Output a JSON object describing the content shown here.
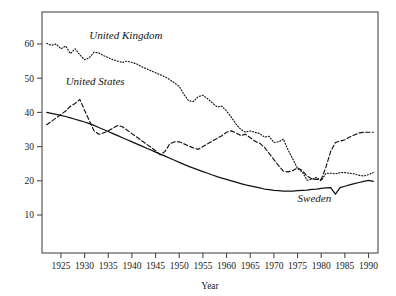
{
  "chart_data": {
    "type": "line",
    "title": "",
    "subtitle": "",
    "xlabel": "Year",
    "ylabel": "",
    "xlim": [
      1921,
      1992
    ],
    "ylim": [
      0,
      65
    ],
    "grid": false,
    "legend_position": "inline-annotations",
    "xticks": [
      1925,
      1930,
      1935,
      1940,
      1945,
      1950,
      1955,
      1960,
      1965,
      1970,
      1975,
      1980,
      1985,
      1990
    ],
    "yticks": [
      10,
      20,
      30,
      40,
      50,
      60
    ],
    "annotations": [
      {
        "text": "United Kingdom",
        "x": 1931,
        "y": 61.5,
        "series": "United Kingdom"
      },
      {
        "text": "United States",
        "x": 1926,
        "y": 48.0,
        "series": "United States"
      },
      {
        "text": "Sweden",
        "x": 1975,
        "y": 13.8,
        "series": "Sweden"
      }
    ],
    "series": [
      {
        "name": "United Kingdom",
        "style": "dotted",
        "x": [
          1922,
          1923,
          1924,
          1925,
          1926,
          1927,
          1928,
          1929,
          1930,
          1931,
          1932,
          1933,
          1934,
          1935,
          1936,
          1937,
          1938,
          1939,
          1940,
          1941,
          1942,
          1943,
          1944,
          1945,
          1946,
          1947,
          1948,
          1949,
          1950,
          1951,
          1952,
          1953,
          1954,
          1955,
          1956,
          1957,
          1958,
          1959,
          1960,
          1961,
          1962,
          1963,
          1964,
          1965,
          1966,
          1967,
          1968,
          1969,
          1970,
          1971,
          1972,
          1973,
          1974,
          1975,
          1976,
          1977,
          1978,
          1979,
          1980,
          1981,
          1982,
          1983,
          1984,
          1985,
          1986,
          1987,
          1988,
          1989,
          1990,
          1991
        ],
        "y": [
          60.2,
          59.6,
          60.0,
          58.6,
          59.4,
          57.2,
          58.6,
          56.8,
          55.4,
          56.0,
          57.6,
          57.4,
          56.6,
          56.0,
          55.4,
          55.0,
          54.6,
          55.0,
          54.6,
          54.2,
          53.4,
          52.8,
          52.2,
          51.6,
          51.0,
          50.4,
          49.6,
          48.6,
          47.6,
          45.2,
          43.4,
          43.2,
          44.6,
          45.0,
          44.0,
          42.8,
          41.6,
          41.8,
          40.4,
          38.6,
          36.6,
          35.0,
          34.2,
          34.6,
          34.2,
          33.8,
          32.8,
          33.0,
          31.2,
          31.4,
          32.2,
          29.0,
          26.4,
          23.6,
          22.6,
          20.2,
          20.4,
          21.0,
          20.0,
          22.2,
          22.2,
          22.0,
          22.4,
          22.4,
          22.2,
          22.0,
          21.6,
          21.4,
          21.8,
          22.4
        ]
      },
      {
        "name": "United States",
        "style": "dashed",
        "x": [
          1922,
          1923,
          1924,
          1925,
          1926,
          1927,
          1928,
          1929,
          1930,
          1931,
          1932,
          1933,
          1934,
          1935,
          1936,
          1937,
          1938,
          1939,
          1940,
          1941,
          1942,
          1943,
          1944,
          1945,
          1946,
          1947,
          1948,
          1949,
          1950,
          1951,
          1952,
          1953,
          1954,
          1955,
          1956,
          1957,
          1958,
          1959,
          1960,
          1961,
          1962,
          1963,
          1964,
          1965,
          1966,
          1967,
          1968,
          1969,
          1970,
          1971,
          1972,
          1973,
          1974,
          1975,
          1976,
          1977,
          1978,
          1979,
          1980,
          1981,
          1982,
          1983,
          1984,
          1985,
          1986,
          1987,
          1988,
          1989,
          1990,
          1991
        ],
        "y": [
          36.4,
          37.4,
          38.4,
          39.4,
          40.4,
          41.8,
          42.6,
          43.8,
          40.6,
          37.6,
          34.6,
          33.6,
          34.0,
          34.6,
          35.4,
          36.2,
          35.8,
          34.8,
          33.8,
          32.8,
          31.8,
          30.8,
          29.8,
          28.8,
          27.6,
          28.6,
          30.8,
          31.4,
          31.4,
          30.8,
          30.2,
          29.6,
          29.2,
          30.0,
          30.8,
          31.6,
          32.4,
          33.2,
          34.2,
          34.6,
          34.0,
          33.2,
          33.6,
          32.6,
          31.6,
          31.0,
          29.8,
          28.0,
          26.2,
          24.4,
          22.8,
          22.6,
          23.0,
          23.8,
          23.0,
          21.4,
          20.6,
          20.4,
          20.4,
          24.0,
          28.6,
          31.2,
          31.6,
          32.0,
          32.8,
          33.4,
          34.0,
          34.2,
          34.2,
          34.2
        ]
      },
      {
        "name": "Sweden",
        "style": "solid",
        "x": [
          1922,
          1923,
          1924,
          1925,
          1926,
          1927,
          1928,
          1929,
          1930,
          1931,
          1932,
          1933,
          1934,
          1935,
          1936,
          1937,
          1938,
          1939,
          1940,
          1941,
          1942,
          1943,
          1944,
          1945,
          1946,
          1947,
          1948,
          1949,
          1950,
          1951,
          1952,
          1953,
          1954,
          1955,
          1956,
          1957,
          1958,
          1959,
          1960,
          1961,
          1962,
          1963,
          1964,
          1965,
          1966,
          1967,
          1968,
          1969,
          1970,
          1971,
          1972,
          1973,
          1974,
          1975,
          1976,
          1977,
          1978,
          1979,
          1980,
          1981,
          1982,
          1983,
          1984,
          1985,
          1986,
          1987,
          1988,
          1989,
          1990,
          1991
        ],
        "y": [
          40.0,
          39.7,
          39.4,
          39.1,
          38.8,
          38.4,
          38.0,
          37.6,
          37.2,
          36.7,
          36.2,
          35.6,
          35.0,
          34.4,
          33.8,
          33.2,
          32.6,
          32.0,
          31.4,
          30.8,
          30.2,
          29.6,
          29.0,
          28.4,
          27.8,
          27.2,
          26.6,
          26.0,
          25.4,
          24.8,
          24.2,
          23.7,
          23.2,
          22.7,
          22.2,
          21.7,
          21.2,
          20.8,
          20.4,
          20.0,
          19.6,
          19.2,
          18.8,
          18.5,
          18.2,
          17.9,
          17.6,
          17.4,
          17.2,
          17.1,
          17.0,
          17.0,
          17.0,
          17.1,
          17.2,
          17.3,
          17.5,
          17.6,
          17.8,
          17.9,
          18.0,
          16.1,
          18.0,
          18.4,
          18.8,
          19.2,
          19.5,
          19.8,
          20.1,
          19.8
        ]
      }
    ]
  }
}
